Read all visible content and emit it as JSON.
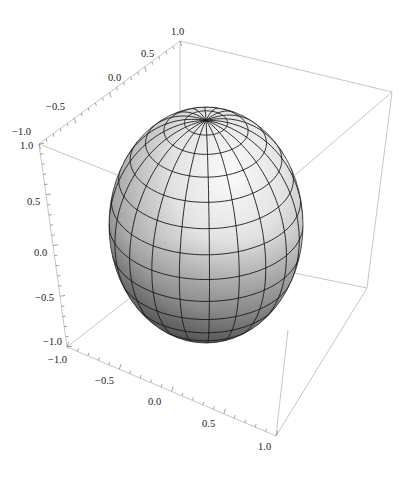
{
  "chart_data": {
    "type": "surface3d",
    "title": "",
    "surface": {
      "shape": "sphere",
      "center": [
        0,
        0,
        0
      ],
      "radius": 1,
      "mesh_latitude_lines": 14,
      "mesh_longitude_lines": 20,
      "color": "#d8d8d8"
    },
    "axes": {
      "x": {
        "label": "",
        "range": [
          -1.0,
          1.0
        ],
        "ticks": [
          "-1.0",
          "-0.5",
          "0.0",
          "0.5",
          "1.0"
        ]
      },
      "y": {
        "label": "",
        "range": [
          -1.0,
          1.0
        ],
        "ticks": [
          "-1.0",
          "-0.5",
          "0.0",
          "0.5",
          "1.0"
        ]
      },
      "z": {
        "label": "",
        "range": [
          -1.0,
          1.0
        ],
        "ticks": [
          "-1.0",
          "-0.5",
          "0.0",
          "0.5",
          "1.0"
        ]
      }
    },
    "box": true,
    "grid": false,
    "legend": null
  },
  "labels": {
    "y_axis": [
      "-1.0",
      "-0.5",
      "0.0",
      "0.5",
      "1.0"
    ],
    "z_axis": [
      "1.0",
      "0.5",
      "0.0",
      "-0.5",
      "-1.0"
    ],
    "x_axis": [
      "-1.0",
      "-0.5",
      "0.0",
      "0.5",
      "1.0"
    ]
  },
  "colors": {
    "box": "#b8b8b8",
    "mesh": "#1a1a1a",
    "sphere_light": "#f4f4f4",
    "sphere_dark": "#5a5a5a"
  }
}
